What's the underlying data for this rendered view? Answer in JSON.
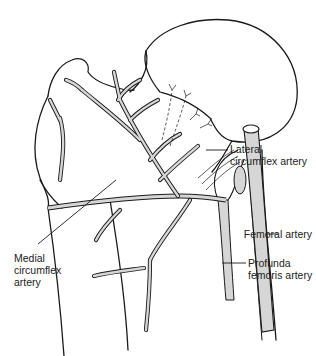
{
  "figure": {
    "type": "anatomical-illustration",
    "colors": {
      "outline": "#1a1a1a",
      "vessel_fill": "#d6d6d6",
      "background": "#ffffff",
      "label_text": "#222222"
    }
  },
  "labels": {
    "lateral_circumflex": "Lateral\ncircumflex artery",
    "medial_circumflex": "Medial\ncircumflex\nartery",
    "femoral": "Femoral artery",
    "profunda_femoris": "Profunda\nfemoris artery"
  }
}
